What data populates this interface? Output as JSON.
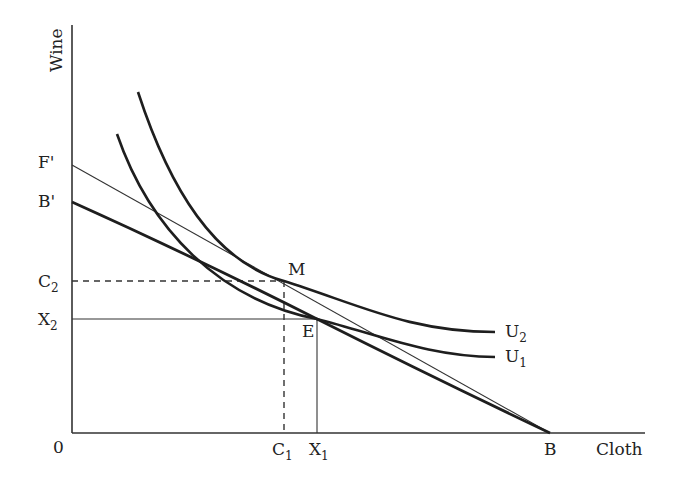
{
  "diagram": {
    "type": "trade-gains-indifference-diagram",
    "axes": {
      "y_label": "Wine",
      "x_label": "Cloth",
      "origin_label": "0"
    },
    "intercepts": {
      "f_prime": "F'",
      "b_prime": "B'",
      "b": "B"
    },
    "levels": {
      "c2": {
        "base": "C",
        "sub": "2"
      },
      "x2": {
        "base": "X",
        "sub": "2"
      },
      "c1": {
        "base": "C",
        "sub": "1"
      },
      "x1": {
        "base": "X",
        "sub": "1"
      }
    },
    "points": {
      "m": "M",
      "e": "E"
    },
    "curves": {
      "u2": {
        "base": "U",
        "sub": "2"
      },
      "u1": {
        "base": "U",
        "sub": "1"
      }
    },
    "lines": [
      {
        "name": "production-possibility line B'B",
        "from": "B'",
        "to": "B",
        "style": "thick"
      },
      {
        "name": "trade line F'B",
        "from": "F'",
        "to": "B",
        "style": "thin"
      }
    ],
    "colors": {
      "ink": "#1e1e1e",
      "background": "#ffffff"
    }
  }
}
